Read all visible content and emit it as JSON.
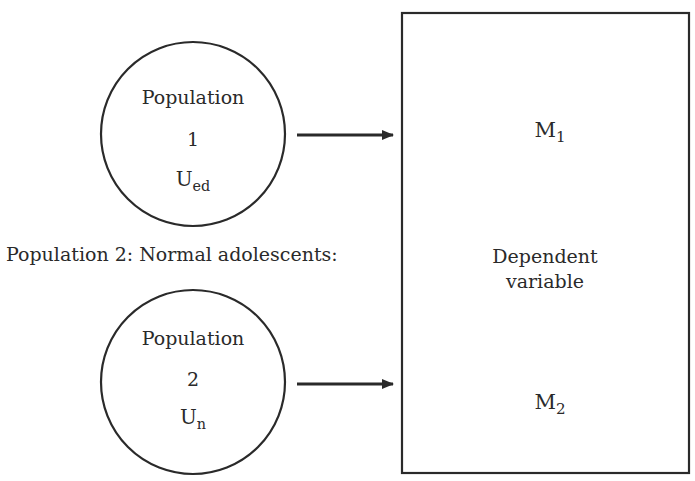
{
  "diagram": {
    "populations": [
      {
        "title": "Population",
        "number": "1",
        "mean_symbol": "U",
        "mean_subscript": "ed"
      },
      {
        "title": "Population",
        "number": "2",
        "mean_symbol": "U",
        "mean_subscript": "n"
      }
    ],
    "population2_caption": "Population 2: Normal adolescents:",
    "dependent_box": {
      "label_line1": "Dependent",
      "label_line2": "variable",
      "means": [
        {
          "symbol": "M",
          "subscript": "1"
        },
        {
          "symbol": "M",
          "subscript": "2"
        }
      ]
    },
    "colors": {
      "stroke": "#2a2a2a",
      "background": "#ffffff"
    }
  }
}
